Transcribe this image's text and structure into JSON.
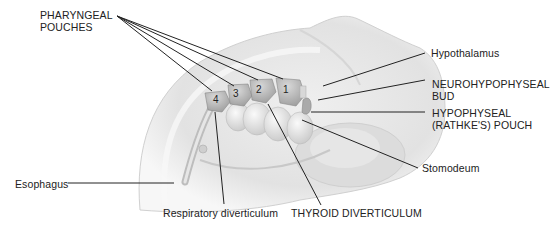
{
  "labels": {
    "pharyngeal_pouches": "PHARYNGEAL\nPOUCHES",
    "hypothalamus": "Hypothalamus",
    "neurohypophyseal_bud": "NEUROHYPOPHYSEAL\nBUD",
    "hypophyseal_pouch": "HYPOPHYSEAL\n(RATHKE'S) POUCH",
    "stomodeum": "Stomodeum",
    "esophagus": "Esophagus",
    "respiratory_diverticulum": "Respiratory diverticulum",
    "thyroid_diverticulum": "THYROID DIVERTICULUM"
  },
  "pouch_numbers": [
    "1",
    "2",
    "3",
    "4"
  ]
}
